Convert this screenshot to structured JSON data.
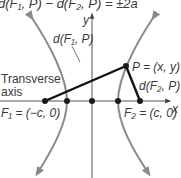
{
  "title_formula": "d(F₁, P) − d(F₂, P) = ±2a",
  "labels": {
    "y_axis": "y",
    "x_axis": "x",
    "d_f1_p": "d(F₁, P)",
    "d_f2_p": "d(F₂, P)",
    "point_p": "P = (x, y)",
    "transverse_line1": "Transverse",
    "transverse_line2": "axis",
    "focus1": "F₁ = (−c, 0)",
    "focus2": "F₂ = (c, 0)"
  },
  "colors": {
    "branch": "#8a8a8a",
    "segment": "#111111",
    "axis": "#555555",
    "text": "#3a3a3a"
  },
  "points": [
    {
      "name": "F1",
      "label": "(-c, 0)"
    },
    {
      "name": "V1",
      "label": "(-a, 0)"
    },
    {
      "name": "O",
      "label": "(0, 0)"
    },
    {
      "name": "V2",
      "label": "(a, 0)"
    },
    {
      "name": "F2",
      "label": "(c, 0)"
    },
    {
      "name": "P",
      "label": "(x, y)"
    }
  ]
}
